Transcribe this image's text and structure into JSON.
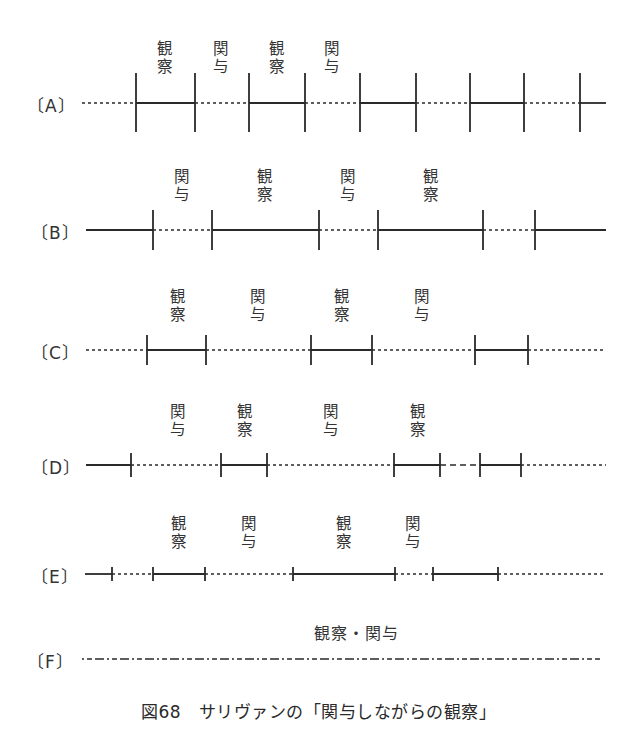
{
  "figure": {
    "caption": "図68　サリヴァンの「関与しながらの観察」",
    "line_color": "#2a2a2a"
  },
  "legend_terms": {
    "observe": "観察",
    "participate": "関与",
    "both": "観察・関与"
  },
  "rows": [
    {
      "id": "A",
      "label": "〔A〕",
      "y": 103,
      "tick_top": 73,
      "tick_bottom": 132,
      "x_start": 82,
      "x_end": 606,
      "ticks": [
        136,
        195,
        249,
        305,
        360,
        416,
        470,
        524,
        580
      ],
      "segments": [
        {
          "from": 82,
          "to": 136,
          "style": "dotted"
        },
        {
          "from": 136,
          "to": 195,
          "style": "solid"
        },
        {
          "from": 195,
          "to": 249,
          "style": "dotted"
        },
        {
          "from": 249,
          "to": 305,
          "style": "solid"
        },
        {
          "from": 305,
          "to": 360,
          "style": "dotted"
        },
        {
          "from": 360,
          "to": 416,
          "style": "solid"
        },
        {
          "from": 416,
          "to": 470,
          "style": "dotted"
        },
        {
          "from": 470,
          "to": 524,
          "style": "solid"
        },
        {
          "from": 524,
          "to": 580,
          "style": "dotted"
        },
        {
          "from": 580,
          "to": 606,
          "style": "solid"
        }
      ],
      "labels": [
        {
          "x": 165,
          "top": 40,
          "chars": [
            "観",
            "察"
          ]
        },
        {
          "x": 221,
          "top": 40,
          "chars": [
            "関",
            "与"
          ]
        },
        {
          "x": 277,
          "top": 40,
          "chars": [
            "観",
            "察"
          ]
        },
        {
          "x": 332,
          "top": 40,
          "chars": [
            "関",
            "与"
          ]
        }
      ]
    },
    {
      "id": "B",
      "label": "〔B〕",
      "y": 230,
      "tick_top": 210,
      "tick_bottom": 250,
      "x_start": 86,
      "x_end": 606,
      "ticks": [
        153,
        212,
        319,
        378,
        483,
        535
      ],
      "segments": [
        {
          "from": 86,
          "to": 153,
          "style": "solid"
        },
        {
          "from": 153,
          "to": 212,
          "style": "dotted"
        },
        {
          "from": 212,
          "to": 319,
          "style": "solid"
        },
        {
          "from": 319,
          "to": 378,
          "style": "dotted"
        },
        {
          "from": 378,
          "to": 483,
          "style": "solid"
        },
        {
          "from": 483,
          "to": 535,
          "style": "dotted"
        },
        {
          "from": 535,
          "to": 606,
          "style": "solid"
        }
      ],
      "labels": [
        {
          "x": 182,
          "top": 168,
          "chars": [
            "関",
            "与"
          ]
        },
        {
          "x": 265,
          "top": 168,
          "chars": [
            "観",
            "察"
          ]
        },
        {
          "x": 348,
          "top": 168,
          "chars": [
            "関",
            "与"
          ]
        },
        {
          "x": 431,
          "top": 168,
          "chars": [
            "観",
            "察"
          ]
        }
      ]
    },
    {
      "id": "C",
      "label": "〔C〕",
      "y": 350,
      "tick_top": 335,
      "tick_bottom": 365,
      "x_start": 86,
      "x_end": 606,
      "ticks": [
        147,
        206,
        311,
        372,
        475,
        528
      ],
      "segments": [
        {
          "from": 86,
          "to": 147,
          "style": "dotted"
        },
        {
          "from": 147,
          "to": 206,
          "style": "solid"
        },
        {
          "from": 206,
          "to": 311,
          "style": "dotted"
        },
        {
          "from": 311,
          "to": 372,
          "style": "solid"
        },
        {
          "from": 372,
          "to": 475,
          "style": "dotted"
        },
        {
          "from": 475,
          "to": 528,
          "style": "solid"
        },
        {
          "from": 528,
          "to": 606,
          "style": "dotted"
        }
      ],
      "labels": [
        {
          "x": 178,
          "top": 288,
          "chars": [
            "観",
            "察"
          ]
        },
        {
          "x": 258,
          "top": 288,
          "chars": [
            "関",
            "与"
          ]
        },
        {
          "x": 342,
          "top": 288,
          "chars": [
            "観",
            "察"
          ]
        },
        {
          "x": 422,
          "top": 288,
          "chars": [
            "関",
            "与"
          ]
        }
      ]
    },
    {
      "id": "D",
      "label": "〔D〕",
      "y": 465,
      "tick_top": 453,
      "tick_bottom": 477,
      "x_start": 86,
      "x_end": 606,
      "ticks": [
        131,
        221,
        267,
        394,
        440,
        480,
        521
      ],
      "segments": [
        {
          "from": 86,
          "to": 131,
          "style": "solid"
        },
        {
          "from": 131,
          "to": 221,
          "style": "dotted"
        },
        {
          "from": 221,
          "to": 267,
          "style": "solid"
        },
        {
          "from": 267,
          "to": 394,
          "style": "dotted"
        },
        {
          "from": 394,
          "to": 440,
          "style": "solid"
        },
        {
          "from": 440,
          "to": 480,
          "style": "dashed"
        },
        {
          "from": 480,
          "to": 521,
          "style": "solid"
        },
        {
          "from": 521,
          "to": 606,
          "style": "dotted"
        }
      ],
      "labels": [
        {
          "x": 178,
          "top": 403,
          "chars": [
            "関",
            "与"
          ]
        },
        {
          "x": 245,
          "top": 403,
          "chars": [
            "観",
            "察"
          ]
        },
        {
          "x": 331,
          "top": 403,
          "chars": [
            "関",
            "与"
          ]
        },
        {
          "x": 418,
          "top": 403,
          "chars": [
            "観",
            "察"
          ]
        }
      ]
    },
    {
      "id": "E",
      "label": "〔E〕",
      "y": 574,
      "tick_top": 567,
      "tick_bottom": 581,
      "x_start": 85,
      "x_end": 606,
      "ticks": [
        112,
        153,
        205,
        293,
        395,
        433,
        498
      ],
      "segments": [
        {
          "from": 85,
          "to": 112,
          "style": "solid"
        },
        {
          "from": 112,
          "to": 153,
          "style": "dotted"
        },
        {
          "from": 153,
          "to": 205,
          "style": "solid"
        },
        {
          "from": 205,
          "to": 293,
          "style": "dotted"
        },
        {
          "from": 293,
          "to": 395,
          "style": "solid"
        },
        {
          "from": 395,
          "to": 433,
          "style": "dotted"
        },
        {
          "from": 433,
          "to": 498,
          "style": "solid"
        },
        {
          "from": 498,
          "to": 606,
          "style": "dotted"
        }
      ],
      "labels": [
        {
          "x": 179,
          "top": 515,
          "chars": [
            "観",
            "察"
          ]
        },
        {
          "x": 249,
          "top": 515,
          "chars": [
            "関",
            "与"
          ]
        },
        {
          "x": 344,
          "top": 515,
          "chars": [
            "観",
            "察"
          ]
        },
        {
          "x": 413,
          "top": 515,
          "chars": [
            "関",
            "与"
          ]
        }
      ]
    },
    {
      "id": "F",
      "label": "〔F〕",
      "y": 659,
      "tick_top": 659,
      "tick_bottom": 659,
      "x_start": 82,
      "x_end": 600,
      "ticks": [],
      "segments": [
        {
          "from": 82,
          "to": 600,
          "style": "chain"
        }
      ],
      "labels": [],
      "top_label": {
        "x": 356,
        "top": 620,
        "text": "観察・関与"
      }
    }
  ],
  "row_label_positions": {
    "A": {
      "left": 27,
      "top": 92
    },
    "B": {
      "left": 31,
      "top": 219
    },
    "C": {
      "left": 31,
      "top": 339
    },
    "D": {
      "left": 31,
      "top": 454
    },
    "E": {
      "left": 31,
      "top": 563
    },
    "F": {
      "left": 27,
      "top": 648
    }
  }
}
